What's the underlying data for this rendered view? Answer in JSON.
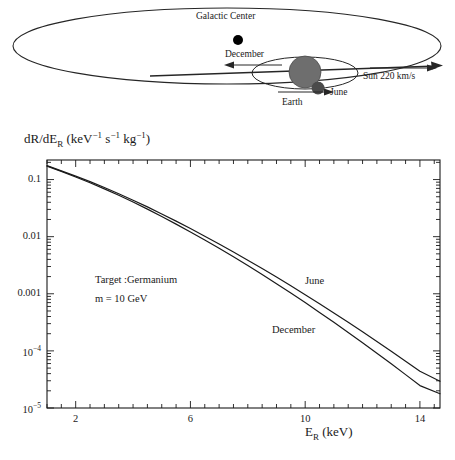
{
  "figure": {
    "schematic": {
      "galactic_center_label": "Galactic Center",
      "december_label": "December",
      "june_label": "June",
      "earth_label": "Earth",
      "sun_velocity_label": "Sun 220 km/s",
      "sun_color": "#6e6e6e",
      "earth_color": "#4a4a4a",
      "galactic_center_color": "#000000",
      "outline_color": "#262626"
    }
  },
  "chart_data": {
    "type": "line",
    "title": "",
    "xlabel": "E_R (keV)",
    "ylabel": "dR/dE_R (keV^-1 s^-1 kg^-1)",
    "xlabel_main": "E",
    "xlabel_sub": "R",
    "xlabel_unit": "(keV)",
    "ylabel_parts": {
      "head": "dR/dE",
      "head_sub": "R",
      "open": " (keV",
      "sup1": "−1",
      "mid": " s",
      "sup2": "−1",
      "mid2": " kg",
      "sup3": "−1",
      "close": ")"
    },
    "yscale": "log",
    "xscale": "linear",
    "xlim": [
      1.0,
      14.7
    ],
    "ylim": [
      1e-05,
      0.22
    ],
    "grid": false,
    "legend_position": "inline-annotation",
    "xticks_major": [
      2,
      6,
      10,
      14
    ],
    "xtick_labels": [
      "2",
      "6",
      "10",
      "14"
    ],
    "xticks_minor_step": 0.5,
    "yticks_major": [
      0.1,
      0.01,
      0.001,
      0.0001,
      1e-05
    ],
    "ytick_labels": [
      "0.1",
      "0.01",
      "0.001",
      "10⁻⁴",
      "10⁻⁵"
    ],
    "ytick_label_plain": [
      "0.1",
      "0.01",
      "0.001",
      "10",
      "10"
    ],
    "ytick_label_sup": [
      "",
      "",
      "",
      "−4",
      "−5"
    ],
    "annotations": [
      {
        "text": "Target :Germanium",
        "x": 2.2,
        "y": 0.0022
      },
      {
        "text": "m = 10 GeV",
        "x": 2.2,
        "y": 0.0011
      }
    ],
    "series": [
      {
        "name": "June",
        "color": "#1a1a1a",
        "label_x": 10.1,
        "label_y": 0.0023,
        "x": [
          1.0,
          1.5,
          2.0,
          2.5,
          3.0,
          3.5,
          4.0,
          4.5,
          5.0,
          5.5,
          6.0,
          6.5,
          7.0,
          7.5,
          8.0,
          8.5,
          9.0,
          9.5,
          10.0,
          10.5,
          11.0,
          11.5,
          12.0,
          12.5,
          13.0,
          13.5,
          14.0,
          14.7
        ],
        "y": [
          0.175,
          0.142,
          0.115,
          0.092,
          0.0725,
          0.0565,
          0.0435,
          0.0332,
          0.025,
          0.0187,
          0.0139,
          0.0102,
          0.00745,
          0.0054,
          0.00388,
          0.00277,
          0.00196,
          0.00138,
          0.000965,
          0.00067,
          0.000462,
          0.000317,
          0.000216,
          0.000146,
          9.85e-05,
          6.6e-05,
          4.4e-05,
          2.95e-05
        ]
      },
      {
        "name": "December",
        "color": "#1a1a1a",
        "label_x": 8.2,
        "label_y": 0.00027,
        "x": [
          1.0,
          1.5,
          2.0,
          2.5,
          3.0,
          3.5,
          4.0,
          4.5,
          5.0,
          5.5,
          6.0,
          6.5,
          7.0,
          7.5,
          8.0,
          8.5,
          9.0,
          9.5,
          10.0,
          10.5,
          11.0,
          11.5,
          12.0,
          12.5,
          13.0,
          13.5,
          14.0,
          14.7
        ],
        "y": [
          0.172,
          0.139,
          0.111,
          0.088,
          0.0687,
          0.053,
          0.0404,
          0.0304,
          0.0226,
          0.0166,
          0.0121,
          0.00875,
          0.00626,
          0.00444,
          0.00312,
          0.00217,
          0.0015,
          0.00103,
          0.0007,
          0.000472,
          0.000316,
          0.00021,
          0.000139,
          9.1e-05,
          5.93e-05,
          3.84e-05,
          2.47e-05,
          1.78e-05
        ]
      }
    ]
  }
}
